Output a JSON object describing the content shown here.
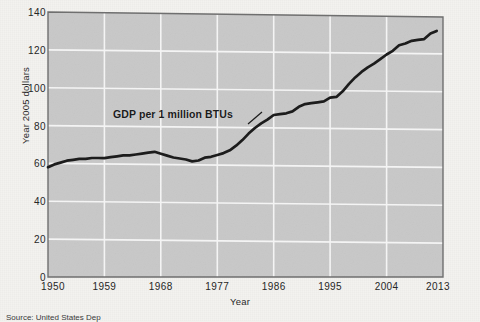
{
  "figure": {
    "source_note": "Source: United States Dep",
    "annotation": "GDP per 1 million BTUs"
  },
  "chart_data": {
    "type": "line",
    "title": "",
    "xlabel": "Year",
    "ylabel": "Year 2005 dollars",
    "xlim": [
      1950,
      2013
    ],
    "ylim": [
      0,
      140
    ],
    "grid": true,
    "legend_position": "none",
    "annotations": [
      {
        "text": "GDP per 1 million BTUs",
        "x": 1969,
        "y": 86,
        "points_to_x": 1985,
        "points_to_y": 80
      }
    ],
    "xticks": [
      1950,
      1959,
      1968,
      1977,
      1986,
      1995,
      2004,
      2013
    ],
    "yticks": [
      0,
      20,
      40,
      60,
      80,
      100,
      120,
      140
    ],
    "series": [
      {
        "name": "GDP per 1 million BTUs",
        "color": "#1c1c1c",
        "x": [
          1950,
          1951,
          1952,
          1953,
          1954,
          1955,
          1956,
          1957,
          1958,
          1959,
          1960,
          1961,
          1962,
          1963,
          1964,
          1965,
          1966,
          1967,
          1968,
          1969,
          1970,
          1971,
          1972,
          1973,
          1974,
          1975,
          1976,
          1977,
          1978,
          1979,
          1980,
          1981,
          1982,
          1983,
          1984,
          1985,
          1986,
          1987,
          1988,
          1989,
          1990,
          1991,
          1992,
          1993,
          1994,
          1995,
          1996,
          1997,
          1998,
          1999,
          2000,
          2001,
          2002,
          2003,
          2004,
          2005,
          2006,
          2007,
          2008,
          2009,
          2010,
          2011,
          2012
        ],
        "values": [
          58,
          59.5,
          60.5,
          61.5,
          62,
          62.5,
          62.5,
          63,
          63,
          63,
          63.5,
          64,
          64.5,
          64.5,
          65,
          65.5,
          66,
          66.5,
          65.5,
          64.5,
          63.5,
          63,
          62.5,
          61.5,
          62,
          63.5,
          64,
          65,
          66,
          67.5,
          70,
          73,
          76.5,
          79.5,
          82,
          84,
          86.5,
          87,
          87.5,
          88.5,
          91,
          92.5,
          93,
          93.5,
          94,
          96,
          96.5,
          99.5,
          103.5,
          107,
          110,
          112.5,
          114.5,
          117,
          119.5,
          121.5,
          124.5,
          125.5,
          127,
          127.5,
          128,
          131,
          132.5
        ]
      }
    ]
  }
}
